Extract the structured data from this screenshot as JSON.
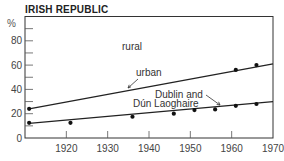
{
  "chart_data": {
    "type": "line",
    "title": "IRISH REPUBLIC",
    "xlabel": "",
    "ylabel": "%",
    "xlim": [
      1910,
      1970
    ],
    "ylim": [
      0,
      100
    ],
    "x_ticks": [
      1920,
      1930,
      1940,
      1950,
      1960,
      1970
    ],
    "y_ticks": [
      0,
      20,
      40,
      60,
      80
    ],
    "y_minor_ticks": [
      10,
      30,
      50,
      70,
      90
    ],
    "grid": false,
    "legend": "none (inline annotations)",
    "series": [
      {
        "name": "urban",
        "points": [
          {
            "x": 1911,
            "y": 24
          },
          {
            "x": 1961,
            "y": 56
          },
          {
            "x": 1966,
            "y": 60
          }
        ],
        "line": {
          "from": {
            "x": 1911,
            "y": 24
          },
          "to": {
            "x": 1970,
            "y": 61
          }
        }
      },
      {
        "name": "Dublin and Dún Laoghaire",
        "points": [
          {
            "x": 1911,
            "y": 12.5
          },
          {
            "x": 1921,
            "y": 12.5
          },
          {
            "x": 1936,
            "y": 17.5
          },
          {
            "x": 1946,
            "y": 20
          },
          {
            "x": 1951,
            "y": 23
          },
          {
            "x": 1956,
            "y": 23.5
          },
          {
            "x": 1961,
            "y": 26.5
          },
          {
            "x": 1966,
            "y": 28
          }
        ],
        "line": {
          "from": {
            "x": 1911,
            "y": 12
          },
          "to": {
            "x": 1970,
            "y": 30
          }
        }
      }
    ],
    "annotations": {
      "rural": "rural",
      "urban": "urban",
      "dublin_line1": "Dublin and",
      "dublin_line2": "Dún Laoghaire"
    }
  }
}
